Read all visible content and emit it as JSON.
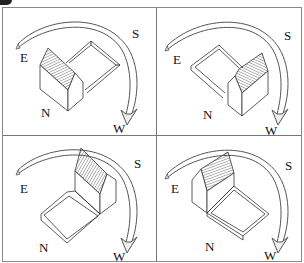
{
  "figure": {
    "panels": [
      {
        "id": "top-left",
        "labels": {
          "east": "E",
          "south": "S",
          "west": "W",
          "north": "N"
        },
        "courtyard_side": "right"
      },
      {
        "id": "top-right",
        "labels": {
          "east": "E",
          "south": "S",
          "west": "W",
          "north": "N"
        },
        "courtyard_side": "left"
      },
      {
        "id": "bottom-left",
        "labels": {
          "east": "E",
          "south": "S",
          "west": "W",
          "north": "N"
        },
        "courtyard_side": "front"
      },
      {
        "id": "bottom-right",
        "labels": {
          "east": "E",
          "south": "S",
          "west": "W",
          "north": "N"
        },
        "courtyard_side": "front-right"
      }
    ]
  }
}
